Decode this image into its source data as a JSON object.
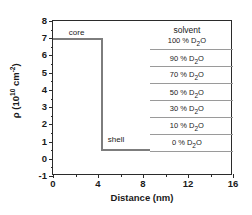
{
  "chart_data": {
    "type": "line",
    "title": "",
    "xlabel": "Distance (nm)",
    "ylabel_text": "ρ (10",
    "ylabel_exp": "10",
    "ylabel_mid": " cm",
    "ylabel_exp2": "-2",
    "ylabel_close": ")",
    "xlim": [
      0,
      16
    ],
    "ylim": [
      -1,
      8
    ],
    "xticks": [
      "0",
      "4",
      "8",
      "12",
      "16"
    ],
    "xtick_values": [
      0,
      4,
      8,
      12,
      16
    ],
    "xminor_values": [
      2,
      6,
      10,
      14
    ],
    "yticks": [
      "8",
      "7",
      "6",
      "5",
      "4",
      "3",
      "2",
      "1",
      "0",
      "-1"
    ],
    "ytick_values": [
      8,
      7,
      6,
      5,
      4,
      3,
      2,
      1,
      0,
      -1
    ],
    "grid": false,
    "legend": "none",
    "series": [
      {
        "name": "core-shell SLD profile",
        "comment": "step profile: core plateau then shell plateau",
        "x": [
          0,
          4.3,
          4.3,
          8.6
        ],
        "y": [
          7.0,
          7.0,
          0.55,
          0.55
        ]
      }
    ],
    "annotations": [
      {
        "label": "core",
        "x": 2.1,
        "y": 7.55
      },
      {
        "label": "shell",
        "x": 5.6,
        "y": 1.3
      },
      {
        "label": "solvent",
        "x": 11.9,
        "y": 7.7
      }
    ],
    "solvent_levels": [
      {
        "label": "100 % D",
        "sub": "2",
        "suffix": "O",
        "value": 6.36,
        "x_start": 8.6,
        "x_end": 16.0,
        "label_x": 11.9,
        "label_y": 7.05
      },
      {
        "label": "90 % D",
        "sub": "2",
        "suffix": "O",
        "value": 5.37,
        "x_start": 8.6,
        "x_end": 16.0,
        "label_x": 11.9,
        "label_y": 6.05
      },
      {
        "label": "70 % D",
        "sub": "2",
        "suffix": "O",
        "value": 4.38,
        "x_start": 8.6,
        "x_end": 16.0,
        "label_x": 11.9,
        "label_y": 5.07
      },
      {
        "label": "50 % D",
        "sub": "2",
        "suffix": "O",
        "value": 3.4,
        "x_start": 8.6,
        "x_end": 16.0,
        "label_x": 11.9,
        "label_y": 4.08
      },
      {
        "label": "30 % D",
        "sub": "2",
        "suffix": "O",
        "value": 2.41,
        "x_start": 8.6,
        "x_end": 16.0,
        "label_x": 11.9,
        "label_y": 3.1
      },
      {
        "label": "10 % D",
        "sub": "2",
        "suffix": "O",
        "value": 1.43,
        "x_start": 8.6,
        "x_end": 16.0,
        "label_x": 11.9,
        "label_y": 2.11
      },
      {
        "label": "0 % D",
        "sub": "2",
        "suffix": "O",
        "value": 0.44,
        "x_start": 8.6,
        "x_end": 16.0,
        "label_x": 11.9,
        "label_y": 1.13
      }
    ]
  }
}
